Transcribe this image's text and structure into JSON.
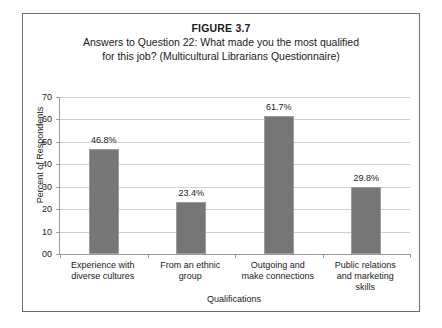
{
  "figure": {
    "number": "FIGURE 3.7",
    "caption_line_1": "Answers to Question 22: What made you the most qualified",
    "caption_line_2": "for this job? (Multicultural Librarians Questionnaire)"
  },
  "chart_data": {
    "type": "bar",
    "title": "FIGURE 3.7",
    "subtitle": "Answers to Question 22: What made you the most qualified for this job? (Multicultural Librarians Questionnaire)",
    "xlabel": "Qualifications",
    "ylabel": "Percent of Respondents",
    "categories": [
      "Experience with diverse cultures",
      "From an ethnic group",
      "Outgoing and make connections",
      "Public relations and marketing skills"
    ],
    "category_lines": [
      [
        "Experience with",
        "diverse cultures"
      ],
      [
        "From an ethnic",
        "group"
      ],
      [
        "Outgoing and",
        "make connections"
      ],
      [
        "Public relations",
        "and marketing",
        "skills"
      ]
    ],
    "values": [
      46.8,
      23.4,
      61.7,
      29.8
    ],
    "data_labels": [
      "46.8%",
      "23.4%",
      "61.7%",
      "29.8%"
    ],
    "ylim": [
      0,
      70
    ],
    "yticks": [
      0,
      10,
      20,
      30,
      40,
      50,
      60,
      70
    ],
    "ytick_labels": [
      "00",
      "10",
      "20",
      "30",
      "40",
      "50",
      "60",
      "70"
    ],
    "grid": true,
    "legend": false,
    "bar_color": "#767676",
    "bar_edge_color": "#9b9b9b",
    "gridline_color": "#cfcfcf"
  }
}
